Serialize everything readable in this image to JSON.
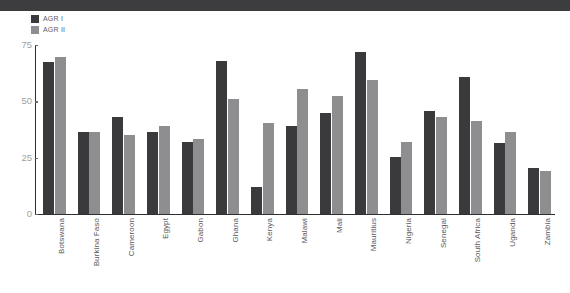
{
  "chart_data": {
    "type": "bar",
    "title": "",
    "subtitle": "",
    "xlabel": "",
    "ylabel": "",
    "ylim": [
      0,
      75
    ],
    "yticks": [
      0,
      25,
      50,
      75
    ],
    "grid": false,
    "legend_position": "top-left",
    "categories": [
      "Botswana",
      "Burkina Faso",
      "Cameroon",
      "Egypt",
      "Gabon",
      "Ghana",
      "Kenya",
      "Malawi",
      "Mali",
      "Mauritius",
      "Nigeria",
      "Senegal",
      "South Africa",
      "Uganda",
      "Zambia"
    ],
    "series": [
      {
        "name": "AGR I",
        "color": "#3a3a3c",
        "values": [
          67.5,
          36.5,
          43,
          36.5,
          32,
          68,
          12,
          39,
          45,
          72,
          25.5,
          45.5,
          61,
          31.5,
          20.5
        ]
      },
      {
        "name": "AGR II",
        "color": "#8e8e90",
        "values": [
          69.5,
          36.5,
          35,
          39,
          33.5,
          51,
          40.5,
          55.5,
          52.5,
          59.5,
          32,
          43,
          41.5,
          36.5,
          19
        ]
      }
    ]
  },
  "legend": {
    "items": [
      {
        "label": "AGR I",
        "color": "#3a3a3c"
      },
      {
        "label": "AGR II",
        "color": "#8e8e90"
      }
    ]
  },
  "axes": {
    "y_tick_labels": [
      "75",
      "50",
      "25",
      "0"
    ]
  },
  "colors": {
    "series_1": "#3a3a3c",
    "series_2": "#8e8e90",
    "axis": "#2e2e30",
    "tick_text": "#a0a0a2",
    "label_text": "#58585a",
    "top_band": "#3d3d3f",
    "background": "#ffffff"
  }
}
